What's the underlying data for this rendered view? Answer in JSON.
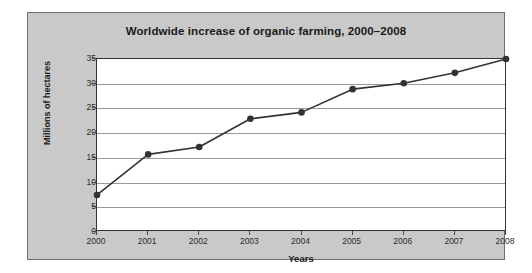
{
  "chart_data": {
    "type": "line",
    "title": "Worldwide increase of organic farming, 2000–2008",
    "xlabel": "Years",
    "ylabel": "Millions of hectares",
    "categories": [
      "2000",
      "2001",
      "2002",
      "2003",
      "2004",
      "2005",
      "2006",
      "2007",
      "2008"
    ],
    "values": [
      7.5,
      15.7,
      17.2,
      22.9,
      24.2,
      28.9,
      30.1,
      32.2,
      35.0
    ],
    "series": [
      {
        "name": "Organic farmland",
        "values": [
          7.5,
          15.7,
          17.2,
          22.9,
          24.2,
          28.9,
          30.1,
          32.2,
          35.0
        ]
      }
    ],
    "ylim": [
      0,
      35
    ],
    "yticks": [
      0,
      5,
      10,
      15,
      20,
      25,
      30,
      35
    ],
    "ytick_labels": [
      "0",
      "5",
      "10",
      "15",
      "20",
      "25",
      "30",
      "35"
    ],
    "xlim": [
      0,
      8
    ],
    "grid": true,
    "grid_axis": "y",
    "legend": false,
    "legend_position": "none",
    "marker": "filled-circle",
    "line_color": "#333333",
    "marker_color": "#333333",
    "plot_background": "#ffffff",
    "panel_background": "#c9c9c9",
    "gridline_color": "#9a9a9a"
  },
  "figure": {
    "background": "#ffffff",
    "panel_border_color": "#6e6e6e"
  }
}
